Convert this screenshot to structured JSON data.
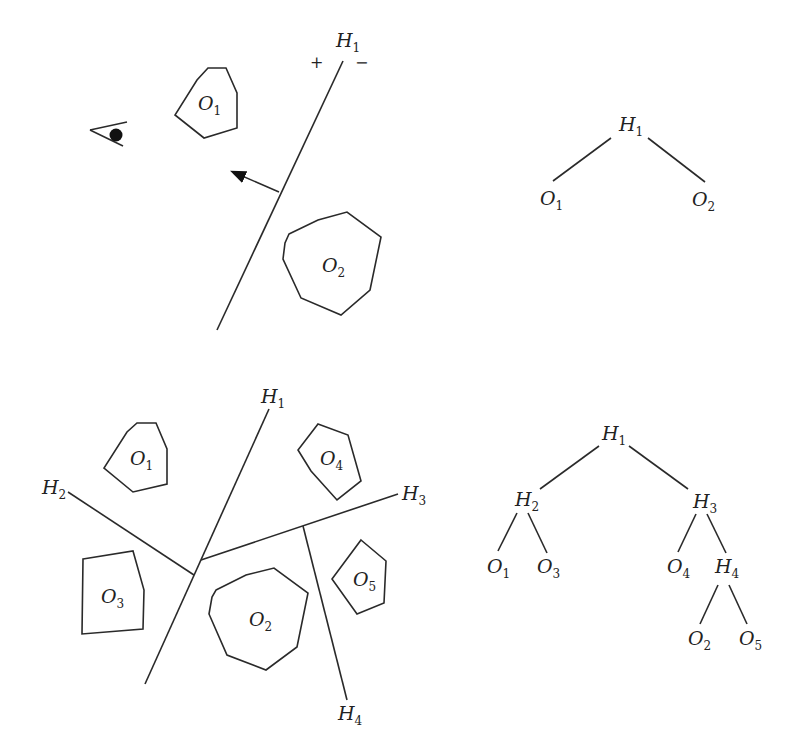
{
  "figure": {
    "top": {
      "scene": {
        "plane": {
          "name": "H",
          "sub": "1",
          "plus": "+",
          "minus": "−"
        },
        "objects": [
          {
            "name": "O",
            "sub": "1"
          },
          {
            "name": "O",
            "sub": "2"
          }
        ],
        "viewer_icon": "eye-icon",
        "normal_arrow": "arrow-icon"
      },
      "tree": {
        "root": {
          "name": "H",
          "sub": "1"
        },
        "left": {
          "name": "O",
          "sub": "1"
        },
        "right": {
          "name": "O",
          "sub": "2"
        }
      }
    },
    "bottom": {
      "scene": {
        "planes": [
          {
            "name": "H",
            "sub": "1"
          },
          {
            "name": "H",
            "sub": "2"
          },
          {
            "name": "H",
            "sub": "3"
          },
          {
            "name": "H",
            "sub": "4"
          }
        ],
        "objects": [
          {
            "name": "O",
            "sub": "1"
          },
          {
            "name": "O",
            "sub": "2"
          },
          {
            "name": "O",
            "sub": "3"
          },
          {
            "name": "O",
            "sub": "4"
          },
          {
            "name": "O",
            "sub": "5"
          }
        ]
      },
      "tree": {
        "nodes": [
          {
            "name": "H",
            "sub": "1"
          },
          {
            "name": "H",
            "sub": "2"
          },
          {
            "name": "H",
            "sub": "3"
          },
          {
            "name": "O",
            "sub": "1"
          },
          {
            "name": "O",
            "sub": "3"
          },
          {
            "name": "O",
            "sub": "4"
          },
          {
            "name": "H",
            "sub": "4"
          },
          {
            "name": "O",
            "sub": "2"
          },
          {
            "name": "O",
            "sub": "5"
          }
        ]
      }
    }
  }
}
